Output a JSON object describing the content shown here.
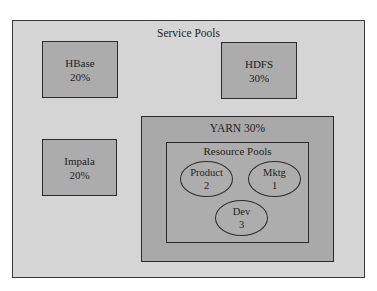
{
  "diagram": {
    "title": "Service Pools",
    "colors": {
      "page_background": "#ffffff",
      "outer_fill": "#d5d5d5",
      "pool_fill": "#acacac",
      "border": "#2b2b2b"
    },
    "service_pools": [
      {
        "name": "HBase",
        "share": "20%"
      },
      {
        "name": "HDFS",
        "share": "30%"
      },
      {
        "name": "Impala",
        "share": "20%"
      }
    ],
    "yarn": {
      "label": "YARN 30%",
      "resource_pools": {
        "title": "Resource Pools",
        "pools": [
          {
            "name": "Product",
            "weight": "2"
          },
          {
            "name": "Mktg",
            "weight": "1"
          },
          {
            "name": "Dev",
            "weight": "3"
          }
        ]
      }
    }
  }
}
